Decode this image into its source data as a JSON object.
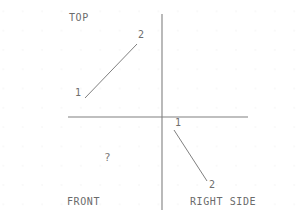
{
  "sheet": {
    "width": 303,
    "height": 216,
    "background_color": "#ffffff",
    "grid_dot_color": "#d8d8d8",
    "grid_spacing_px": 19,
    "line_color": "#808080",
    "text_color": "#6b6b6b"
  },
  "axes": {
    "name": "projection-axes",
    "horizontal": {
      "x1": 68,
      "y1": 117,
      "x2": 248,
      "y2": 117
    },
    "vertical": {
      "x1": 162,
      "y1": 14,
      "x2": 162,
      "y2": 210
    },
    "origin": {
      "x": 162,
      "y": 117
    }
  },
  "views": {
    "top": {
      "label": "TOP",
      "label_x": 69,
      "label_y": 13,
      "quadrant": "upper-left",
      "line": {
        "x1": 85,
        "y1": 98,
        "x2": 137,
        "y2": 44
      },
      "points": [
        {
          "label": "1",
          "x": 75,
          "y": 88
        },
        {
          "label": "2",
          "x": 138,
          "y": 30
        }
      ]
    },
    "front": {
      "label": "FRONT",
      "label_x": 67,
      "label_y": 197,
      "quadrant": "lower-left",
      "missing": true,
      "placeholder": {
        "label": "?",
        "x": 104,
        "y": 152
      }
    },
    "right_side": {
      "label": "RIGHT SIDE",
      "label_x": 190,
      "label_y": 197,
      "quadrant": "lower-right",
      "line": {
        "x1": 174,
        "y1": 130,
        "x2": 207,
        "y2": 181
      },
      "points": [
        {
          "label": "1",
          "x": 175,
          "y": 118
        },
        {
          "label": "2",
          "x": 209,
          "y": 180
        }
      ]
    }
  }
}
